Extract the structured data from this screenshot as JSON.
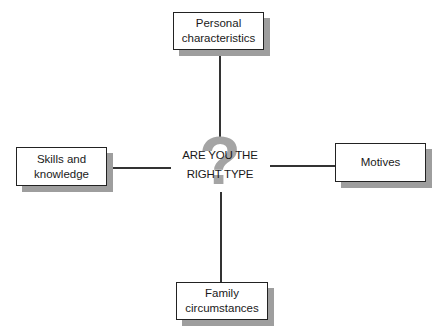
{
  "diagram": {
    "center": {
      "line1": "ARE YOU THE",
      "line2": "RIGHT TYPE",
      "icon": "question-mark-icon",
      "icon_glyph": "?",
      "icon_color": "#a4a4a4"
    },
    "nodes": {
      "top": {
        "line1": "Personal",
        "line2": "characteristics"
      },
      "left": {
        "line1": "Skills and",
        "line2": "knowledge"
      },
      "right": {
        "line1": "Motives",
        "line2": ""
      },
      "bottom": {
        "line1": "Family",
        "line2": "circumstances"
      }
    },
    "colors": {
      "border": "#222222",
      "line": "#333333",
      "shadow": "#d6d6d6"
    }
  }
}
